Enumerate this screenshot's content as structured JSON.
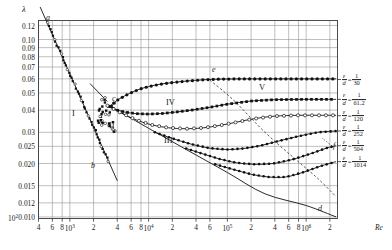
{
  "figure": {
    "kind": "nikuradse-diagram",
    "y_axis_symbol": "λ",
    "x_axis_symbol": "Re"
  },
  "axes": {
    "y_ticks": [
      "0.12",
      "0.10",
      "0.09",
      "0.08",
      "0.07",
      "0.06",
      "0.05",
      "0.04",
      "0.03",
      "0.025",
      "0.020",
      "0.015",
      "0.012",
      "0.010"
    ],
    "y_values": [
      0.12,
      0.1,
      0.09,
      0.08,
      0.07,
      0.06,
      0.05,
      0.04,
      0.03,
      0.025,
      0.02,
      0.015,
      0.012,
      0.01
    ],
    "x_ticks": [
      {
        "label": "4",
        "value": 400
      },
      {
        "label": "6",
        "value": 600
      },
      {
        "label": "8",
        "value": 800
      },
      {
        "label": "10",
        "exp": "3",
        "value": 1000
      },
      {
        "label": "2",
        "value": 2000
      },
      {
        "label": "4",
        "value": 4000
      },
      {
        "label": "6",
        "value": 6000
      },
      {
        "label": "8",
        "value": 8000
      },
      {
        "label": "10",
        "exp": "4",
        "value": 10000
      },
      {
        "label": "2",
        "value": 20000
      },
      {
        "label": "4",
        "value": 40000
      },
      {
        "label": "6",
        "value": 60000
      },
      {
        "label": "10",
        "exp": "5",
        "value": 100000
      },
      {
        "label": "2",
        "value": 200000
      },
      {
        "label": "4",
        "value": 400000
      },
      {
        "label": "6",
        "value": 600000
      },
      {
        "label": "8",
        "value": 800000
      },
      {
        "label": "10",
        "exp": "6",
        "value": 1000000
      },
      {
        "label": "2",
        "value": 2000000
      }
    ],
    "x_min": 400,
    "x_max": 2500000,
    "y_min": 0.0098,
    "y_max": 0.128,
    "grid": "both"
  },
  "annotations": {
    "a": "a",
    "b": "b",
    "c": "c",
    "d": "d",
    "e": "e",
    "f": "f",
    "region_I": "I",
    "region_II": "II",
    "region_III": "III",
    "region_IV": "IV",
    "region_V": "V"
  },
  "roughness_labels": [
    {
      "num": "ε",
      "den": "d",
      "value_num": "1",
      "value_den": "30",
      "y": 0.0595
    },
    {
      "num": "ε",
      "den": "d",
      "value_num": "1",
      "value_den": "61.2",
      "y": 0.046
    },
    {
      "num": "ε",
      "den": "d",
      "value_num": "1",
      "value_den": "120",
      "y": 0.0372
    },
    {
      "num": "ε",
      "den": "d",
      "value_num": "1",
      "value_den": "252",
      "y": 0.0305
    },
    {
      "num": "ε",
      "den": "d",
      "value_num": "1",
      "value_den": "504",
      "y": 0.0252
    },
    {
      "num": "ε",
      "den": "d",
      "value_num": "1",
      "value_den": "1014",
      "y": 0.0205
    }
  ],
  "chart_data": {
    "type": "line",
    "title": "",
    "xlabel": "Re",
    "ylabel": "λ",
    "xscale": "log",
    "yscale": "log",
    "xlim": [
      400,
      2500000
    ],
    "ylim": [
      0.0098,
      0.128
    ],
    "grid": true,
    "legend": "right-side roughness ratio labels",
    "series": [
      {
        "name": "laminar-line-ab",
        "label": "a-b (λ = 64/Re)",
        "style": "solid-line",
        "x": [
          420,
          1000,
          2000,
          3000,
          4000
        ],
        "y": [
          0.1524,
          0.064,
          0.032,
          0.02133,
          0.016
        ]
      },
      {
        "name": "blasius-line-cd",
        "label": "c-d (smooth pipe turbulent)",
        "style": "solid-line",
        "x": [
          3000,
          6000,
          10000,
          30000,
          100000,
          300000,
          1000000,
          2400000
        ],
        "y": [
          0.0429,
          0.036,
          0.0316,
          0.024,
          0.0178,
          0.0135,
          0.0116,
          0.01
        ]
      },
      {
        "name": "transition-line-Ic",
        "label": "I to c",
        "style": "solid-line",
        "x": [
          1800,
          3000
        ],
        "y": [
          0.0565,
          0.0447
        ]
      },
      {
        "name": "eps-d-30",
        "label": "ε/d = 1/30",
        "roughness": 0.03333,
        "style": "filled-circles",
        "x": [
          3200,
          4000,
          5000,
          6500,
          8000,
          10000,
          14000,
          20000,
          30000,
          50000,
          80000,
          150000,
          300000,
          700000,
          1500000,
          2400000
        ],
        "y": [
          0.042,
          0.0455,
          0.0482,
          0.051,
          0.0528,
          0.0543,
          0.056,
          0.0572,
          0.0583,
          0.0593,
          0.0598,
          0.06,
          0.06,
          0.06,
          0.06,
          0.06
        ]
      },
      {
        "name": "eps-d-61",
        "label": "ε/d = 1/61.2",
        "roughness": 0.01634,
        "style": "filled-squares",
        "x": [
          3100,
          4000,
          5000,
          7000,
          10000,
          15000,
          22000,
          35000,
          60000,
          100000,
          200000,
          400000,
          900000,
          1600000,
          2400000
        ],
        "y": [
          0.042,
          0.04,
          0.039,
          0.0382,
          0.038,
          0.0383,
          0.039,
          0.04,
          0.0415,
          0.0432,
          0.045,
          0.0458,
          0.046,
          0.046,
          0.046
        ]
      },
      {
        "name": "eps-d-120",
        "label": "ε/d = 1/120",
        "roughness": 0.00833,
        "style": "open-circles",
        "x": [
          3000,
          4500,
          7000,
          11000,
          18000,
          30000,
          50000,
          80000,
          130000,
          220000,
          400000,
          800000,
          1500000,
          2400000
        ],
        "y": [
          0.0424,
          0.0385,
          0.0352,
          0.033,
          0.0318,
          0.0314,
          0.0318,
          0.0328,
          0.0342,
          0.0358,
          0.037,
          0.0374,
          0.0374,
          0.0374
        ]
      },
      {
        "name": "eps-d-252",
        "label": "ε/d = 1/252",
        "roughness": 0.00397,
        "style": "filled-circles-small",
        "x": [
          12000,
          20000,
          35000,
          60000,
          100000,
          160000,
          260000,
          450000,
          800000,
          1400000,
          2400000
        ],
        "y": [
          0.03,
          0.0277,
          0.0257,
          0.0244,
          0.024,
          0.0243,
          0.0252,
          0.0268,
          0.0285,
          0.03,
          0.0305
        ]
      },
      {
        "name": "eps-d-504",
        "label": "ε/d = 1/504",
        "roughness": 0.00198,
        "style": "filled-circles-small",
        "x": [
          30000,
          50000,
          80000,
          130000,
          220000,
          380000,
          650000,
          1100000,
          1800000,
          2400000
        ],
        "y": [
          0.0243,
          0.0226,
          0.0212,
          0.0202,
          0.0198,
          0.02,
          0.021,
          0.0226,
          0.0244,
          0.0252
        ]
      },
      {
        "name": "eps-d-1014",
        "label": "ε/d = 1/1014",
        "roughness": 0.00099,
        "style": "filled-circles-small",
        "x": [
          70000,
          120000,
          200000,
          330000,
          550000,
          900000,
          1500000,
          2400000
        ],
        "y": [
          0.0198,
          0.0185,
          0.0174,
          0.0168,
          0.0168,
          0.0178,
          0.0193,
          0.0205
        ]
      },
      {
        "name": "dashed-envelope-e",
        "label": "e (fully-rough onset envelope)",
        "style": "dashed-line",
        "x": [
          60000,
          120000,
          300000,
          700000,
          1400000,
          2400000
        ],
        "y": [
          0.059,
          0.0455,
          0.03,
          0.0215,
          0.0165,
          0.013
        ]
      }
    ]
  }
}
